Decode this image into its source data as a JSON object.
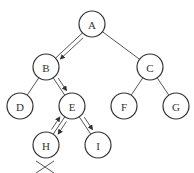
{
  "diagram": {
    "type": "binary-tree",
    "nodes": [
      {
        "id": "A",
        "label": "A"
      },
      {
        "id": "B",
        "label": "B"
      },
      {
        "id": "C",
        "label": "C"
      },
      {
        "id": "D",
        "label": "D"
      },
      {
        "id": "E",
        "label": "E"
      },
      {
        "id": "F",
        "label": "F"
      },
      {
        "id": "G",
        "label": "G"
      },
      {
        "id": "H",
        "label": "H"
      },
      {
        "id": "I",
        "label": "I"
      }
    ],
    "edges": [
      {
        "from": "A",
        "to": "B"
      },
      {
        "from": "A",
        "to": "C"
      },
      {
        "from": "B",
        "to": "D"
      },
      {
        "from": "B",
        "to": "E"
      },
      {
        "from": "C",
        "to": "F"
      },
      {
        "from": "C",
        "to": "G"
      },
      {
        "from": "E",
        "to": "H"
      },
      {
        "from": "E",
        "to": "I"
      }
    ],
    "traversal_arrows": [
      {
        "from": "A",
        "to": "B",
        "bidirectional": false,
        "note": "down arrow with return line"
      },
      {
        "from": "B",
        "to": "E",
        "bidirectional": false
      },
      {
        "from": "E",
        "to": "H",
        "bidirectional": true
      },
      {
        "from": "E",
        "to": "I",
        "bidirectional": false
      }
    ],
    "crossed_node": "H",
    "caption": ""
  }
}
